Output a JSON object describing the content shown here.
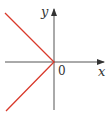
{
  "diagram": {
    "type": "function-graph",
    "axes": {
      "x_label": "x",
      "y_label": "y",
      "origin_label": "0",
      "axis_color": "#555555"
    },
    "curve": {
      "description": "two rays meeting at origin, extending to upper-left and lower-left",
      "color": "#d9392b",
      "points": [
        [
          -1,
          1
        ],
        [
          0,
          0
        ],
        [
          -1,
          -1
        ]
      ]
    }
  }
}
